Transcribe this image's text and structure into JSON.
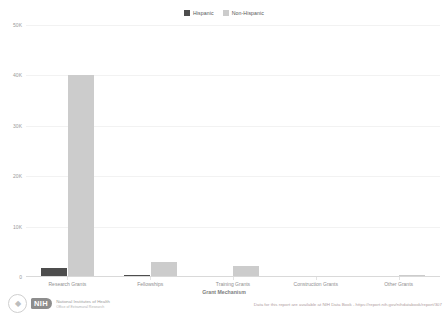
{
  "chart_data": {
    "type": "bar",
    "title": "",
    "xlabel": "Grant Mechanism",
    "ylabel": "",
    "categories": [
      "Research Grants",
      "Fellowships",
      "Training Grants",
      "Construction Grants",
      "Other Grants"
    ],
    "series": [
      {
        "name": "Hispanic",
        "color": "#4d4d4d",
        "values": [
          1850,
          330,
          220,
          0,
          60
        ]
      },
      {
        "name": "Non-Hispanic",
        "color": "#cccccc",
        "values": [
          40100,
          3000,
          2200,
          40,
          330
        ]
      }
    ],
    "ylim": [
      0,
      50000
    ],
    "yticks": [
      0,
      10000,
      20000,
      30000,
      40000,
      50000
    ],
    "ytick_labels": [
      "0",
      "10K",
      "20K",
      "30K",
      "40K",
      "50K"
    ],
    "grid": true,
    "legend_position": "top-center"
  },
  "legend": {
    "items": [
      {
        "label": "Hispanic",
        "color": "#4d4d4d"
      },
      {
        "label": "Non-Hispanic",
        "color": "#cccccc"
      }
    ]
  },
  "footer": {
    "source_note": "Data for this report are available at NIH Data Book - https://report.nih.gov/nihdatabook/report/307",
    "brand": {
      "pill": "NIH",
      "line1": "National Institutes of Health",
      "line2": "Office of Extramural Research"
    }
  }
}
